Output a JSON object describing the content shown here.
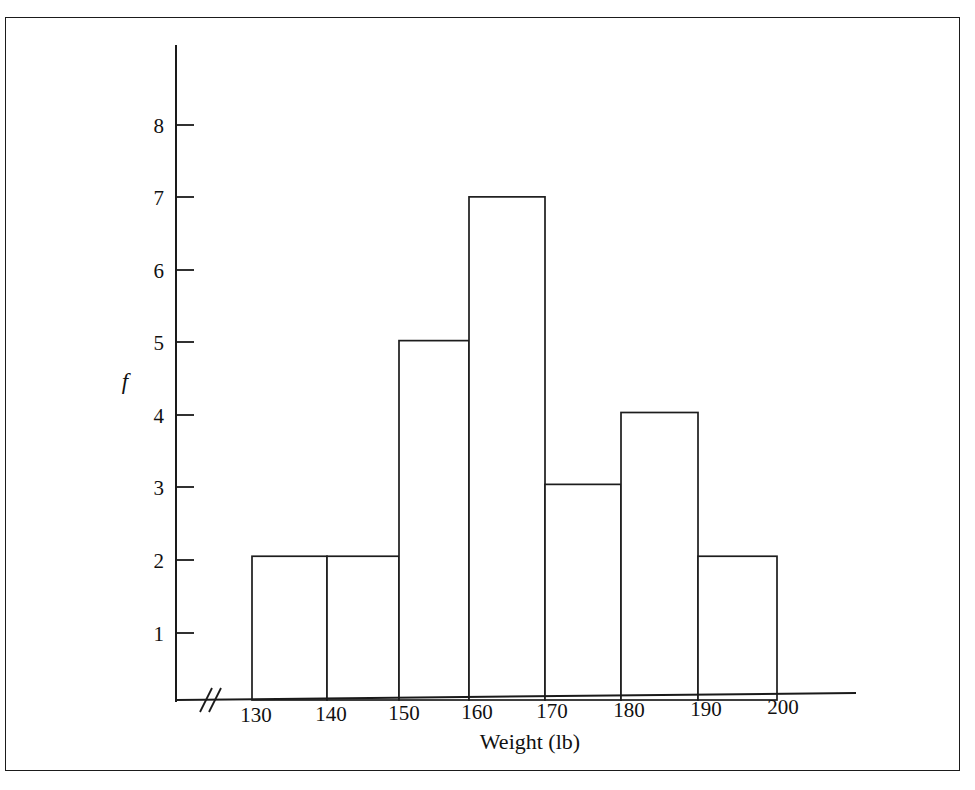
{
  "figure": {
    "background_color": "#ffffff",
    "ink_color": "#1a1a1a",
    "frame_border_color": "#1b1b1b"
  },
  "axes": {
    "y_axis_label": "f",
    "x_axis_label": "Weight (lb)",
    "y_tick_labels": [
      "1",
      "2",
      "3",
      "4",
      "5",
      "6",
      "7",
      "8"
    ],
    "x_tick_labels": [
      "130",
      "140",
      "150",
      "160",
      "170",
      "180",
      "190",
      "200"
    ],
    "axis_break_symbol": "axis-break"
  },
  "chart_data": {
    "type": "bar",
    "title": "",
    "subtitle": "",
    "xlabel": "Weight (lb)",
    "ylabel": "f",
    "categories": [
      "130-140",
      "140-150",
      "150-160",
      "160-170",
      "170-180",
      "180-190",
      "190-200"
    ],
    "bin_edges": [
      130,
      140,
      150,
      160,
      170,
      180,
      190,
      200
    ],
    "values": [
      2,
      2,
      5,
      7,
      3,
      4,
      2
    ],
    "xlim": [
      130,
      200
    ],
    "ylim": [
      0,
      8
    ],
    "x_ticks": [
      130,
      140,
      150,
      160,
      170,
      180,
      190,
      200
    ],
    "y_ticks": [
      1,
      2,
      3,
      4,
      5,
      6,
      7,
      8
    ],
    "grid": false,
    "legend": null
  }
}
